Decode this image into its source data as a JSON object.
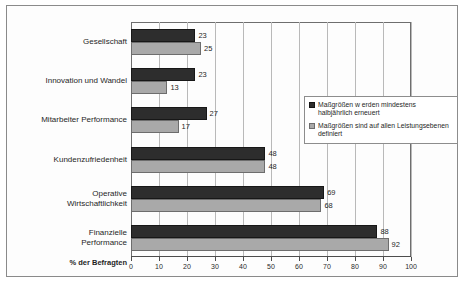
{
  "chart_data": {
    "type": "bar",
    "orientation": "horizontal",
    "title": "",
    "xlabel": "% der Befragten",
    "ylabel": "",
    "xlim": [
      0,
      100
    ],
    "xticks": [
      0,
      10,
      20,
      30,
      40,
      50,
      60,
      70,
      80,
      90,
      100
    ],
    "grid": true,
    "legend_position": "center-right",
    "categories": [
      "Gesellschaft",
      "Innovation und Wandel",
      "Mitarbeiter Performance",
      "Kundenzufriedenheit",
      "Operative\nWirtschaftlichkeit",
      "Finanzielle\nPerformance"
    ],
    "series": [
      {
        "name": "Maßgrößen werden mindestens halbjährlich erneuert",
        "color": "#2d2d2d",
        "values": [
          23,
          23,
          27,
          48,
          69,
          88
        ]
      },
      {
        "name": "Maßgrößen sind auf allen Leistungsebenen definiert",
        "color": "#a9a9a9",
        "values": [
          25,
          13,
          17,
          48,
          68,
          92
        ]
      }
    ]
  },
  "legend": {
    "entries": [
      {
        "line1": "Maßgrößen w erden mindestens",
        "line2": "halbjährlich erneuert"
      },
      {
        "line1": "Maßgrößen sind auf allen Leistungsebenen",
        "line2": "definiert"
      }
    ]
  },
  "axis": {
    "title": "% der Befragten",
    "ticks": [
      "0",
      "10",
      "20",
      "30",
      "40",
      "50",
      "60",
      "70",
      "80",
      "90",
      "100"
    ]
  },
  "colors": {
    "series_dark": "#2d2d2d",
    "series_light": "#a9a9a9",
    "frame": "#8a8a8a",
    "grid": "#b9b9b9"
  }
}
